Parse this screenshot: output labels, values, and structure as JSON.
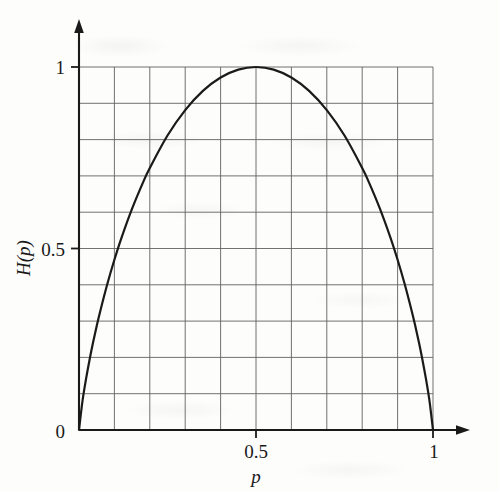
{
  "figure": {
    "background_color": "#fdfdfc",
    "ink_color": "#1a1a1a",
    "grid_color": "#5a5a5a",
    "curve_color": "#1a1a1a"
  },
  "chart_data": {
    "type": "line",
    "title": "",
    "xlabel": "p",
    "ylabel": "H(p)",
    "xlim": [
      0,
      1
    ],
    "ylim": [
      0,
      1
    ],
    "grid": true,
    "grid_columns": 10,
    "grid_rows": 10,
    "legend": "none",
    "x_tick_labels": [
      "0",
      "0.5",
      "1"
    ],
    "x_tick_values": [
      0,
      0.5,
      1
    ],
    "y_tick_labels": [
      "0",
      "0.5",
      "1"
    ],
    "y_tick_values": [
      0,
      0.5,
      1
    ],
    "series": [
      {
        "name": "H(p)",
        "x": [
          0,
          0.01,
          0.02,
          0.03,
          0.04,
          0.05,
          0.06,
          0.08,
          0.1,
          0.12,
          0.15,
          0.18,
          0.2,
          0.25,
          0.3,
          0.35,
          0.4,
          0.45,
          0.5,
          0.55,
          0.6,
          0.65,
          0.7,
          0.75,
          0.8,
          0.82,
          0.85,
          0.88,
          0.9,
          0.92,
          0.94,
          0.95,
          0.96,
          0.97,
          0.98,
          0.99,
          1
        ],
        "values": [
          0,
          0.0808,
          0.1414,
          0.1944,
          0.2423,
          0.2864,
          0.3274,
          0.4022,
          0.469,
          0.5294,
          0.6098,
          0.6801,
          0.7219,
          0.8113,
          0.8813,
          0.9341,
          0.971,
          0.9928,
          1,
          0.9928,
          0.971,
          0.9341,
          0.8813,
          0.8113,
          0.7219,
          0.6801,
          0.6098,
          0.5294,
          0.469,
          0.4022,
          0.3274,
          0.2864,
          0.2423,
          0.1944,
          0.1414,
          0.0808,
          0
        ]
      }
    ],
    "peak": {
      "x": 0.5,
      "y": 1
    }
  },
  "axes": {
    "x_axis_has_arrow": true,
    "y_axis_has_arrow": true,
    "x_label": "p",
    "y_label": "H(p)"
  }
}
